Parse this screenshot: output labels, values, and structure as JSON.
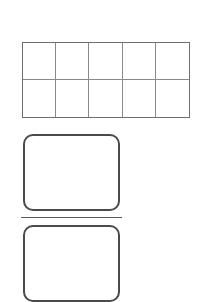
{
  "page": {
    "background_color": "#ffffff",
    "width": 204,
    "height": 285
  },
  "ten_frame": {
    "name": "ten-frame",
    "columns": 5,
    "rows": 2,
    "total_cells": 10,
    "filled_cells": 0,
    "border_color": "#6f6f6f",
    "gridline_color": "#8a8a8a",
    "fill_color": "#ffffff",
    "cells": [
      {
        "index": 1,
        "row": 1,
        "col": 1,
        "value": ""
      },
      {
        "index": 2,
        "row": 1,
        "col": 2,
        "value": ""
      },
      {
        "index": 3,
        "row": 1,
        "col": 3,
        "value": ""
      },
      {
        "index": 4,
        "row": 1,
        "col": 4,
        "value": ""
      },
      {
        "index": 5,
        "row": 1,
        "col": 5,
        "value": ""
      },
      {
        "index": 6,
        "row": 2,
        "col": 1,
        "value": ""
      },
      {
        "index": 7,
        "row": 2,
        "col": 2,
        "value": ""
      },
      {
        "index": 8,
        "row": 2,
        "col": 3,
        "value": ""
      },
      {
        "index": 9,
        "row": 2,
        "col": 4,
        "value": ""
      },
      {
        "index": 10,
        "row": 2,
        "col": 5,
        "value": ""
      }
    ]
  },
  "answer_boxes": [
    {
      "name": "answer-box-1",
      "value": "",
      "placeholder": "",
      "border_color": "#4a4a4a",
      "fill_color": "#ffffff"
    },
    {
      "name": "answer-box-2",
      "value": "",
      "placeholder": "",
      "border_color": "#4a4a4a",
      "fill_color": "#ffffff"
    }
  ],
  "divider": {
    "name": "divider-rule",
    "color": "#5a5a5a"
  }
}
